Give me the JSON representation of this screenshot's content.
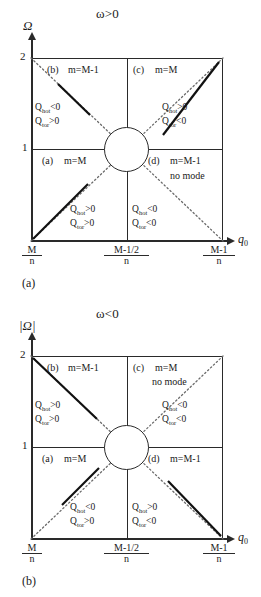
{
  "figure": {
    "type": "diagram",
    "panels": [
      {
        "tag": "(a)",
        "title": "ω>0",
        "y_axis_label": "Ω",
        "x_axis_label": "q",
        "x_axis_sub": "0",
        "y_ticks": [
          "1",
          "2"
        ],
        "x_ticks": [
          {
            "num": "M",
            "den": "n"
          },
          {
            "num": "M-1/2",
            "den": "n"
          },
          {
            "num": "M-1",
            "den": "n"
          }
        ],
        "quadrants": [
          {
            "key": "b",
            "label": "(b)",
            "mode": "m=M-1",
            "no_mode": "",
            "q_hot": "Q",
            "q_hot_sub": "hot",
            "q_hot_rel": "<0",
            "q_tor": "Q",
            "q_tor_sub": "tor",
            "q_tor_rel": ">0"
          },
          {
            "key": "c",
            "label": "(c)",
            "mode": "m=M",
            "no_mode": "",
            "q_hot": "Q",
            "q_hot_sub": "hot",
            "q_hot_rel": ">0",
            "q_tor": "Q",
            "q_tor_sub": "tor",
            "q_tor_rel": "<0"
          },
          {
            "key": "a",
            "label": "(a)",
            "mode": "m=M",
            "no_mode": "",
            "q_hot": "Q",
            "q_hot_sub": "hot",
            "q_hot_rel": ">0",
            "q_tor": "Q",
            "q_tor_sub": "tor",
            "q_tor_rel": ">0"
          },
          {
            "key": "d",
            "label": "(d)",
            "mode": "m=M-1",
            "no_mode": "no mode",
            "q_hot": "Q",
            "q_hot_sub": "hot",
            "q_hot_rel": "<0",
            "q_tor": "Q",
            "q_tor_sub": "tor",
            "q_tor_rel": "<0"
          }
        ]
      },
      {
        "tag": "(b)",
        "title": "ω<0",
        "y_axis_label": "|Ω|",
        "x_axis_label": "q",
        "x_axis_sub": "0",
        "y_ticks": [
          "1",
          "2"
        ],
        "x_ticks": [
          {
            "num": "M",
            "den": "n"
          },
          {
            "num": "M-1/2",
            "den": "n"
          },
          {
            "num": "M-1",
            "den": "n"
          }
        ],
        "quadrants": [
          {
            "key": "b",
            "label": "(b)",
            "mode": "m=M-1",
            "no_mode": "",
            "q_hot": "Q",
            "q_hot_sub": "hot",
            "q_hot_rel": ">0",
            "q_tor": "Q",
            "q_tor_sub": "tor",
            "q_tor_rel": ">0"
          },
          {
            "key": "c",
            "label": "(c)",
            "mode": "m=M",
            "no_mode": "no mode",
            "q_hot": "Q",
            "q_hot_sub": "hot",
            "q_hot_rel": "<0",
            "q_tor": "Q",
            "q_tor_sub": "tor",
            "q_tor_rel": "<0"
          },
          {
            "key": "a",
            "label": "(a)",
            "mode": "m=M",
            "no_mode": "",
            "q_hot": "Q",
            "q_hot_sub": "hot",
            "q_hot_rel": "<0",
            "q_tor": "Q",
            "q_tor_sub": "tor",
            "q_tor_rel": ">0"
          },
          {
            "key": "d",
            "label": "(d)",
            "mode": "m=M-1",
            "no_mode": "",
            "q_hot": "Q",
            "q_hot_sub": "hot",
            "q_hot_rel": ">0",
            "q_tor": "Q",
            "q_tor_sub": "tor",
            "q_tor_rel": "<0"
          }
        ]
      }
    ],
    "colors": {
      "line": "#2a2a2a",
      "background": "#ffffff",
      "dotted": "#6b6b6b"
    }
  }
}
